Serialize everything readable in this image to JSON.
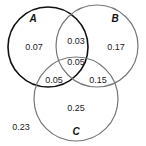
{
  "diagram": {
    "type": "venn",
    "sets": [
      {
        "name": "A",
        "cx": 48,
        "cy": 47,
        "r": 40,
        "stroke": "#111111",
        "width": 1.6
      },
      {
        "name": "B",
        "cx": 97,
        "cy": 46,
        "r": 41,
        "stroke": "#777777",
        "width": 1.2
      },
      {
        "name": "C",
        "cx": 76,
        "cy": 99,
        "r": 42,
        "stroke": "#777777",
        "width": 1.2
      }
    ],
    "regions": {
      "A_only": "0.07",
      "B_only": "0.17",
      "C_only": "0.25",
      "AB_only": "0.03",
      "AC_only": "0.05",
      "BC_only": "0.15",
      "ABC": "0.05",
      "none": "0.23"
    }
  }
}
